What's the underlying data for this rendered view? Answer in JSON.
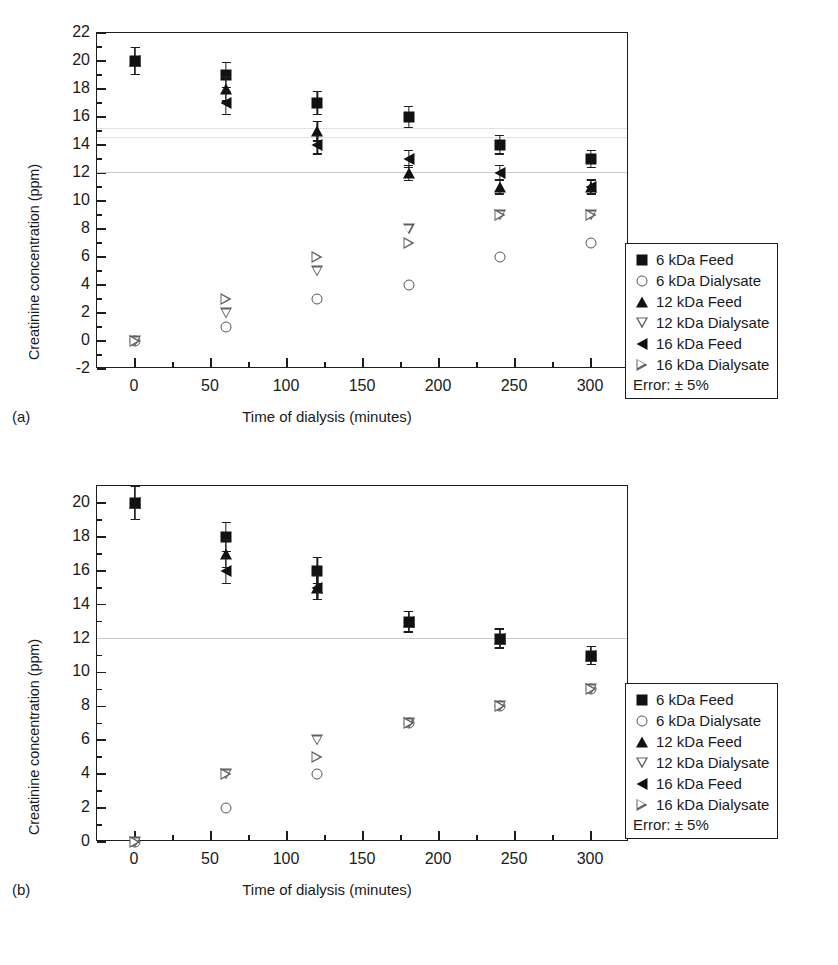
{
  "figure": {
    "axis_title_x": "Time of dialysis (minutes)",
    "axis_title_y": "Creatinine concentration (ppm)",
    "panel_a_tag": "(a)",
    "panel_b_tag": "(b)",
    "legend_error": "Error: ± 5%",
    "legend_entries": [
      {
        "label": "6 kDa Feed",
        "marker": "filled-square"
      },
      {
        "label": "6 kDa Dialysate",
        "marker": "open-circle"
      },
      {
        "label": "12 kDa Feed",
        "marker": "filled-triangle-up"
      },
      {
        "label": "12 kDa Dialysate",
        "marker": "open-triangle-down"
      },
      {
        "label": "16 kDa Feed",
        "marker": "filled-triangle-left"
      },
      {
        "label": "16 kDa Dialysate",
        "marker": "open-triangle-right"
      }
    ],
    "colors": {
      "axis": "#1d1d1d",
      "filled_marker": "#111111",
      "open_marker": "#606060",
      "background": "#ffffff"
    }
  },
  "chart_data": [
    {
      "id": "panel-a",
      "type": "scatter",
      "title": "(a)",
      "xlabel": "Time of dialysis (minutes)",
      "ylabel": "Creatinine concentration (ppm)",
      "xlim": [
        -25,
        325
      ],
      "ylim": [
        -2,
        22
      ],
      "xticks": [
        0,
        50,
        100,
        150,
        200,
        250,
        300
      ],
      "yticks": [
        -2,
        0,
        2,
        4,
        6,
        8,
        10,
        12,
        14,
        16,
        18,
        20,
        22
      ],
      "yminor_step": 1,
      "xminor_step": 25,
      "grid": false,
      "error_pct": 5,
      "x": [
        0,
        60,
        120,
        180,
        240,
        300
      ],
      "series": [
        {
          "name": "6 kDa Feed",
          "marker": "filled-square",
          "values": [
            20,
            19,
            17,
            16,
            14,
            13
          ]
        },
        {
          "name": "12 kDa Feed",
          "marker": "filled-triangle-up",
          "values": [
            20,
            18,
            15,
            12,
            11,
            11
          ]
        },
        {
          "name": "16 kDa Feed",
          "marker": "filled-triangle-left",
          "values": [
            20,
            17,
            14,
            13,
            12,
            11
          ]
        },
        {
          "name": "6 kDa Dialysate",
          "marker": "open-circle",
          "values": [
            0,
            1,
            3,
            4,
            6,
            7
          ]
        },
        {
          "name": "12 kDa Dialysate",
          "marker": "open-triangle-down",
          "values": [
            0,
            2,
            5,
            8,
            9,
            9
          ]
        },
        {
          "name": "16 kDa Dialysate",
          "marker": "open-triangle-right",
          "values": [
            0,
            3,
            6,
            7,
            9,
            9
          ]
        }
      ]
    },
    {
      "id": "panel-b",
      "type": "scatter",
      "title": "(b)",
      "xlabel": "Time of dialysis (minutes)",
      "ylabel": "Creatinine concentration (ppm)",
      "xlim": [
        -25,
        325
      ],
      "ylim": [
        0,
        21
      ],
      "xticks": [
        0,
        50,
        100,
        150,
        200,
        250,
        300
      ],
      "yticks": [
        0,
        2,
        4,
        6,
        8,
        10,
        12,
        14,
        16,
        18,
        20
      ],
      "yminor_step": 1,
      "xminor_step": 25,
      "grid": false,
      "error_pct": 5,
      "x": [
        0,
        60,
        120,
        180,
        240,
        300
      ],
      "series": [
        {
          "name": "6 kDa Feed",
          "marker": "filled-square",
          "values": [
            20,
            18,
            16,
            13,
            12,
            11
          ]
        },
        {
          "name": "12 kDa Feed",
          "marker": "filled-triangle-up",
          "values": [
            20,
            17,
            15,
            13,
            12,
            11
          ]
        },
        {
          "name": "16 kDa Feed",
          "marker": "filled-triangle-left",
          "values": [
            20,
            16,
            15,
            13,
            12,
            11
          ]
        },
        {
          "name": "6 kDa Dialysate",
          "marker": "open-circle",
          "values": [
            0,
            2,
            4,
            7,
            8,
            9
          ]
        },
        {
          "name": "12 kDa Dialysate",
          "marker": "open-triangle-down",
          "values": [
            0,
            4,
            6,
            7,
            8,
            9
          ]
        },
        {
          "name": "16 kDa Dialysate",
          "marker": "open-triangle-right",
          "values": [
            0,
            4,
            5,
            7,
            8,
            9
          ]
        }
      ]
    }
  ]
}
